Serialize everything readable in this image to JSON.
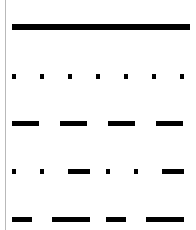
{
  "figure": {
    "background_color": "#ffffff",
    "width": 196,
    "height": 230,
    "axis_spine_color": "#b9b9b9"
  },
  "chart_data": {
    "type": "line",
    "title": "",
    "subtitle": "",
    "xlabel": "",
    "ylabel": "",
    "grid": false,
    "legend_position": "none",
    "x": [
      0,
      1
    ],
    "xlim": [
      0,
      1
    ],
    "ylim": [
      0,
      5
    ],
    "stroke_color": "#000000",
    "series": [
      {
        "name": "solid",
        "index": 1,
        "y": 4,
        "y_pixel": 27,
        "linewidth": 6,
        "dash_pattern": "solid",
        "dash_array": [],
        "segment_lengths_px": [
          178
        ],
        "gap_lengths_px": [],
        "values": [
          4,
          4
        ]
      },
      {
        "name": "dotted",
        "index": 2,
        "y": 3,
        "y_pixel": 76,
        "linewidth": 5,
        "dash_pattern": "dotted",
        "dash_array": [
          4,
          24
        ],
        "segment_lengths_px": [
          4
        ],
        "gap_lengths_px": [
          24
        ],
        "dot_count": 7,
        "values": [
          3,
          3
        ]
      },
      {
        "name": "dashed",
        "index": 3,
        "y": 2,
        "y_pixel": 123,
        "linewidth": 5,
        "dash_pattern": "dashed",
        "dash_array": [
          27,
          21
        ],
        "segment_lengths_px": [
          27
        ],
        "gap_lengths_px": [
          21
        ],
        "dash_count": 4,
        "values": [
          2,
          2
        ]
      },
      {
        "name": "dash-dot-dot",
        "index": 4,
        "y": 1,
        "y_pixel": 171,
        "linewidth": 5,
        "dash_pattern": "dashdot",
        "dash_array": [
          4,
          24,
          4,
          24,
          22,
          16
        ],
        "segment_lengths_px": [
          4,
          4,
          22
        ],
        "gap_lengths_px": [
          24,
          24,
          16
        ],
        "values": [
          1,
          1
        ]
      },
      {
        "name": "long-short-dash",
        "index": 5,
        "y": 0,
        "y_pixel": 219,
        "linewidth": 5,
        "dash_pattern": "longdash-shortdash",
        "dash_array": [
          20,
          20,
          38,
          16
        ],
        "segment_lengths_px": [
          20,
          38
        ],
        "gap_lengths_px": [
          20,
          16
        ],
        "values": [
          0,
          0
        ]
      }
    ]
  }
}
